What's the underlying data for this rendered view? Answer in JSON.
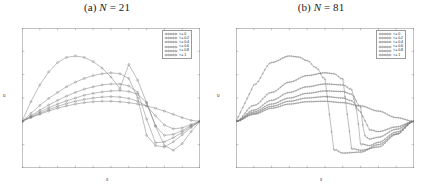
{
  "figure": {
    "panels": [
      {
        "id": "panel-a",
        "title_prefix": "(a) ",
        "title_var": "N",
        "title_eq": " = ",
        "title_value": "21",
        "title_full": "(a) N = 21"
      },
      {
        "id": "panel-b",
        "title_prefix": "(b) ",
        "title_var": "N",
        "title_eq": " = ",
        "title_value": "81",
        "title_full": "(b) N = 81"
      }
    ]
  },
  "axes": {
    "xlabel": "x",
    "ylabel": "u",
    "xticks": [
      "0",
      "0.1",
      "0.2",
      "0.3",
      "0.4",
      "0.5",
      "0.6",
      "0.7",
      "0.8",
      "0.9",
      "1"
    ],
    "yticks": [
      "2",
      "1.5",
      "1",
      "0.5",
      "0",
      "-0.5",
      "-1"
    ],
    "xlim": [
      0,
      1
    ],
    "ylim": [
      -1,
      2
    ]
  },
  "legend": {
    "position": "top-right",
    "entries": [
      {
        "label": "t = 0",
        "color": "#6e6e6e",
        "marker": "circle"
      },
      {
        "label": "t = 0.2",
        "color": "#6e6e6e",
        "marker": "circle"
      },
      {
        "label": "t = 0.4",
        "color": "#6e6e6e",
        "marker": "circle"
      },
      {
        "label": "t = 0.6",
        "color": "#6e6e6e",
        "marker": "circle"
      },
      {
        "label": "t = 0.8",
        "color": "#6e6e6e",
        "marker": "circle"
      },
      {
        "label": "t = 1",
        "color": "#6e6e6e",
        "marker": "circle"
      }
    ]
  },
  "chart_data": [
    {
      "type": "line",
      "title": "(a) N = 21",
      "xlabel": "x",
      "ylabel": "u",
      "xlim": [
        0,
        1
      ],
      "ylim": [
        -1,
        2
      ],
      "grid": false,
      "legend_position": "upper right",
      "n_points": 21,
      "markers": "circle",
      "series": [
        {
          "name": "t = 0",
          "x": [
            0,
            0.05,
            0.1,
            0.15,
            0.2,
            0.25,
            0.3,
            0.35,
            0.4,
            0.45,
            0.5,
            0.55,
            0.6,
            0.65,
            0.7,
            0.75,
            0.8,
            0.85,
            0.9,
            0.95,
            1
          ],
          "values": [
            0,
            0.08,
            0.15,
            0.22,
            0.28,
            0.33,
            0.37,
            0.4,
            0.42,
            0.43,
            0.43,
            0.42,
            0.4,
            0.37,
            0.33,
            0.28,
            0.22,
            0.15,
            0.08,
            0.02,
            0
          ]
        },
        {
          "name": "t = 0.2",
          "x": [
            0,
            0.05,
            0.1,
            0.15,
            0.2,
            0.25,
            0.3,
            0.35,
            0.4,
            0.45,
            0.5,
            0.55,
            0.6,
            0.65,
            0.7,
            0.75,
            0.8,
            0.85,
            0.9,
            0.95,
            1
          ],
          "values": [
            0,
            0.09,
            0.17,
            0.25,
            0.32,
            0.38,
            0.43,
            0.47,
            0.5,
            0.52,
            0.53,
            0.52,
            0.49,
            0.43,
            0.33,
            0.12,
            -0.08,
            -0.16,
            -0.14,
            -0.07,
            0
          ]
        },
        {
          "name": "t = 0.4",
          "x": [
            0,
            0.05,
            0.1,
            0.15,
            0.2,
            0.25,
            0.3,
            0.35,
            0.4,
            0.45,
            0.5,
            0.55,
            0.6,
            0.65,
            0.7,
            0.75,
            0.8,
            0.85,
            0.9,
            0.95,
            1
          ],
          "values": [
            0,
            0.1,
            0.2,
            0.29,
            0.37,
            0.44,
            0.5,
            0.56,
            0.6,
            0.63,
            0.65,
            0.66,
            0.64,
            0.58,
            0.4,
            -0.1,
            -0.3,
            -0.28,
            -0.2,
            -0.09,
            0
          ]
        },
        {
          "name": "t = 0.6",
          "x": [
            0,
            0.05,
            0.1,
            0.15,
            0.2,
            0.25,
            0.3,
            0.35,
            0.4,
            0.45,
            0.5,
            0.55,
            0.6,
            0.65,
            0.7,
            0.75,
            0.8,
            0.85,
            0.9,
            0.95,
            1
          ],
          "values": [
            0,
            0.12,
            0.24,
            0.35,
            0.45,
            0.54,
            0.62,
            0.69,
            0.74,
            0.78,
            0.8,
            0.8,
            0.76,
            0.62,
            0.05,
            -0.46,
            -0.44,
            -0.35,
            -0.24,
            -0.11,
            0
          ]
        },
        {
          "name": "t = 0.8",
          "x": [
            0,
            0.05,
            0.1,
            0.15,
            0.2,
            0.25,
            0.3,
            0.35,
            0.4,
            0.45,
            0.5,
            0.55,
            0.6,
            0.65,
            0.7,
            0.75,
            0.8,
            0.85,
            0.9,
            0.95,
            1
          ],
          "values": [
            0,
            0.17,
            0.34,
            0.49,
            0.62,
            0.74,
            0.84,
            0.92,
            0.98,
            1.02,
            1.04,
            1.02,
            0.92,
            0.5,
            -0.3,
            -0.52,
            -0.55,
            -0.44,
            -0.29,
            -0.13,
            0
          ]
        },
        {
          "name": "t = 1",
          "x": [
            0,
            0.05,
            0.1,
            0.15,
            0.2,
            0.25,
            0.3,
            0.35,
            0.4,
            0.45,
            0.5,
            0.55,
            0.6,
            0.65,
            0.7,
            0.75,
            0.8,
            0.85,
            0.9,
            0.95,
            1
          ],
          "values": [
            0,
            0.42,
            0.78,
            1.06,
            1.26,
            1.37,
            1.4,
            1.37,
            1.28,
            1.14,
            0.95,
            0.7,
            1.22,
            0.88,
            0.4,
            -0.1,
            -0.52,
            -0.62,
            -0.48,
            -0.22,
            0
          ]
        }
      ]
    },
    {
      "type": "line",
      "title": "(b) N = 81",
      "xlabel": "x",
      "ylabel": "u",
      "xlim": [
        0,
        1
      ],
      "ylim": [
        -1,
        2
      ],
      "grid": false,
      "legend_position": "upper right",
      "n_points": 81,
      "markers": "circle",
      "series": [
        {
          "name": "t = 0",
          "x": [
            0,
            0.1,
            0.2,
            0.3,
            0.4,
            0.5,
            0.6,
            0.7,
            0.8,
            0.9,
            1
          ],
          "values": [
            0,
            0.15,
            0.28,
            0.37,
            0.42,
            0.43,
            0.4,
            0.33,
            0.22,
            0.08,
            0
          ]
        },
        {
          "name": "t = 0.2",
          "x": [
            0,
            0.1,
            0.2,
            0.3,
            0.4,
            0.5,
            0.6,
            0.65,
            0.7,
            0.75,
            0.8,
            0.9,
            1
          ],
          "values": [
            0,
            0.17,
            0.32,
            0.43,
            0.5,
            0.53,
            0.5,
            0.44,
            0.2,
            -0.18,
            -0.22,
            -0.12,
            0
          ]
        },
        {
          "name": "t = 0.4",
          "x": [
            0,
            0.1,
            0.2,
            0.3,
            0.4,
            0.5,
            0.6,
            0.65,
            0.7,
            0.72,
            0.75,
            0.8,
            0.9,
            1
          ],
          "values": [
            0,
            0.2,
            0.37,
            0.5,
            0.6,
            0.65,
            0.64,
            0.58,
            0.3,
            -0.3,
            -0.38,
            -0.34,
            -0.17,
            0
          ]
        },
        {
          "name": "t = 0.6",
          "x": [
            0,
            0.1,
            0.2,
            0.3,
            0.4,
            0.5,
            0.6,
            0.65,
            0.68,
            0.7,
            0.75,
            0.8,
            0.9,
            1
          ],
          "values": [
            0,
            0.24,
            0.45,
            0.62,
            0.74,
            0.8,
            0.78,
            0.68,
            0.2,
            -0.48,
            -0.52,
            -0.45,
            -0.23,
            0
          ]
        },
        {
          "name": "t = 0.8",
          "x": [
            0,
            0.1,
            0.2,
            0.3,
            0.4,
            0.5,
            0.55,
            0.6,
            0.62,
            0.65,
            0.7,
            0.8,
            0.9,
            1
          ],
          "values": [
            0,
            0.34,
            0.62,
            0.84,
            0.98,
            1.04,
            1.02,
            0.9,
            0.3,
            -0.58,
            -0.62,
            -0.55,
            -0.28,
            0
          ]
        },
        {
          "name": "t = 1",
          "x": [
            0,
            0.1,
            0.2,
            0.3,
            0.35,
            0.4,
            0.45,
            0.5,
            0.52,
            0.55,
            0.6,
            0.7,
            0.8,
            0.9,
            1
          ],
          "values": [
            0,
            0.78,
            1.26,
            1.4,
            1.38,
            1.3,
            1.15,
            0.9,
            0.3,
            -0.6,
            -0.68,
            -0.66,
            -0.5,
            -0.27,
            0
          ]
        }
      ]
    }
  ]
}
